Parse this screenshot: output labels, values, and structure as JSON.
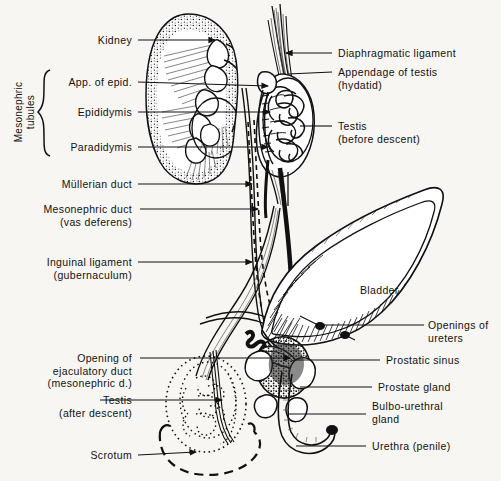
{
  "figure": {
    "kind": "anatomical-line-drawing",
    "style": "black ink line drawing with stipple and hatching on cream paper",
    "background_color": "#f8f6f2",
    "ink_color": "#111111"
  },
  "group_labels": [
    {
      "name": "mesonephric-tubules",
      "text": "Mesonephric\ntubules",
      "orientation": "vertical",
      "x": 24,
      "y": 112,
      "brace": {
        "x": 44,
        "top": 70,
        "bottom": 156
      }
    }
  ],
  "labels_left": [
    {
      "name": "kidney",
      "lines": [
        "Kidney"
      ],
      "text_right": 132,
      "y": 40,
      "leader": {
        "x1": 138,
        "y1": 40,
        "x2": 215,
        "y2": 40,
        "arrow": true
      }
    },
    {
      "name": "app-of-epid",
      "lines": [
        "App. of epid."
      ],
      "text_right": 132,
      "y": 82,
      "leader": {
        "x1": 138,
        "y1": 82,
        "x2": 268,
        "y2": 86,
        "arrow": true
      }
    },
    {
      "name": "epididymis",
      "lines": [
        "Epididymis"
      ],
      "text_right": 132,
      "y": 112,
      "leader": {
        "x1": 138,
        "y1": 112,
        "x2": 270,
        "y2": 112,
        "arrow": true
      }
    },
    {
      "name": "paradidymis",
      "lines": [
        "Paradidymis"
      ],
      "text_right": 132,
      "y": 147,
      "leader": {
        "x1": 138,
        "y1": 147,
        "x2": 268,
        "y2": 147,
        "arrow": true
      }
    },
    {
      "name": "mullerian-duct",
      "lines": [
        "Müllerian duct"
      ],
      "text_right": 132,
      "y": 184,
      "leader": {
        "x1": 138,
        "y1": 184,
        "x2": 252,
        "y2": 184,
        "arrow": true
      }
    },
    {
      "name": "mesonephric-duct",
      "lines": [
        "Mesonephric duct",
        "(vas deferens)"
      ],
      "text_right": 132,
      "y": 209,
      "leader": {
        "x1": 140,
        "y1": 209,
        "x2": 258,
        "y2": 209,
        "arrow": true
      }
    },
    {
      "name": "inguinal-ligament",
      "lines": [
        "Inguinal ligament",
        "(gubernaculum)"
      ],
      "text_right": 132,
      "y": 262,
      "leader": {
        "x1": 138,
        "y1": 262,
        "x2": 252,
        "y2": 262,
        "arrow": true
      }
    },
    {
      "name": "opening-ejaculatory-duct",
      "lines": [
        "Opening of",
        "ejaculatory duct",
        "(mesonephric d.)"
      ],
      "text_right": 132,
      "y": 358,
      "leader": {
        "x1": 140,
        "y1": 358,
        "x2": 290,
        "y2": 358,
        "arrow": true
      }
    },
    {
      "name": "testis-after-descent",
      "lines": [
        "Testis",
        "(after descent)"
      ],
      "text_right": 132,
      "y": 400,
      "leader": {
        "x1": 100,
        "y1": 400,
        "x2": 222,
        "y2": 400,
        "arrow": true
      }
    },
    {
      "name": "scrotum",
      "lines": [
        "Scrotum"
      ],
      "text_right": 132,
      "y": 455,
      "leader": {
        "x1": 138,
        "y1": 455,
        "x2": 196,
        "y2": 452,
        "arrow": true
      }
    }
  ],
  "labels_right": [
    {
      "name": "diaphragmatic-ligament",
      "lines": [
        "Diaphragmatic ligament"
      ],
      "text_left": 338,
      "y": 53,
      "leader": {
        "x1": 332,
        "y1": 53,
        "x2": 286,
        "y2": 53,
        "arrow": true
      }
    },
    {
      "name": "appendage-of-testis",
      "lines": [
        "Appendage of testis",
        "(hydatid)"
      ],
      "text_left": 338,
      "y": 72,
      "leader": {
        "x1": 332,
        "y1": 72,
        "x2": 288,
        "y2": 74,
        "arrow": false
      }
    },
    {
      "name": "testis-before-descent",
      "lines": [
        "Testis",
        "(before descent)"
      ],
      "text_left": 338,
      "y": 126,
      "leader": {
        "x1": 332,
        "y1": 126,
        "x2": 300,
        "y2": 126,
        "arrow": false
      }
    },
    {
      "name": "bladder",
      "lines": [
        "Bladder"
      ],
      "text_left": 360,
      "y": 290,
      "leader": null
    },
    {
      "name": "openings-of-ureters",
      "lines": [
        "Openings of",
        "ureters"
      ],
      "text_left": 428,
      "y": 325,
      "leader": {
        "x1": 424,
        "y1": 325,
        "x2": 320,
        "y2": 325,
        "arrow": false
      }
    },
    {
      "name": "prostatic-sinus",
      "lines": [
        "Prostatic sinus"
      ],
      "text_left": 386,
      "y": 360,
      "leader": {
        "x1": 380,
        "y1": 360,
        "x2": 294,
        "y2": 360,
        "arrow": false
      }
    },
    {
      "name": "prostate-gland",
      "lines": [
        "Prostate gland"
      ],
      "text_left": 378,
      "y": 387,
      "leader": {
        "x1": 372,
        "y1": 387,
        "x2": 300,
        "y2": 387,
        "arrow": false
      }
    },
    {
      "name": "bulbo-urethral-gland",
      "lines": [
        "Bulbo-urethral",
        "gland"
      ],
      "text_left": 372,
      "y": 406,
      "leader": {
        "x1": 366,
        "y1": 414,
        "x2": 288,
        "y2": 414,
        "arrow": false
      }
    },
    {
      "name": "urethra-penile",
      "lines": [
        "Urethra (penile)"
      ],
      "text_left": 372,
      "y": 446,
      "leader": {
        "x1": 366,
        "y1": 446,
        "x2": 296,
        "y2": 446,
        "arrow": false
      }
    }
  ],
  "structures": [
    {
      "name": "kidney",
      "note": "large bean-shaped organ, stippled cortex, medullary pyramids with radiating striations, calyces"
    },
    {
      "name": "ureter",
      "note": "tube descending from kidney hilum to bladder"
    },
    {
      "name": "testis-before-descent",
      "note": "ovoid body high in abdomen filled with coiled seminiferous tubules"
    },
    {
      "name": "diaphragmatic-ligament",
      "note": "narrow fibrous band ascending from upper pole of testis"
    },
    {
      "name": "appendage-of-testis",
      "note": "small hydatid vesicle on the upper testis"
    },
    {
      "name": "mullerian-duct",
      "note": "dashed line duct running the length of the diagram"
    },
    {
      "name": "mesonephric-duct",
      "note": "heavy solid black duct (vas deferens)"
    },
    {
      "name": "gubernaculum",
      "note": "inguinal ligament curving down to the scrotum"
    },
    {
      "name": "bladder",
      "note": "large leaf-shaped sac with hatched wall, apex to upper right"
    },
    {
      "name": "prostate-gland",
      "note": "lobed gland around the urethra below the bladder"
    },
    {
      "name": "bulbo-urethral-gland",
      "note": "small paired glands beside the urethra"
    },
    {
      "name": "urethra-penile",
      "note": "hooked tube curving right and up from the bulb"
    },
    {
      "name": "testis-after-descent",
      "note": "dotted outline of the testis in the scrotum"
    },
    {
      "name": "scrotum",
      "note": "dashed outline of the scrotal sac"
    }
  ]
}
